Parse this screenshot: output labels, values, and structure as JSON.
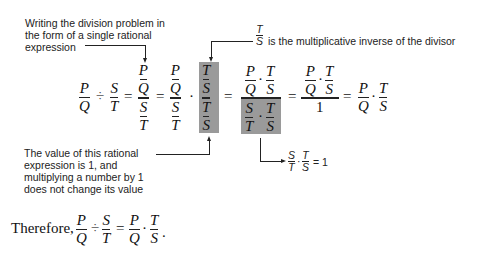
{
  "annotations": {
    "top_left_lines": [
      "Writing the division problem in",
      "the form of a single rational",
      "expression"
    ],
    "top_right": {
      "frac_num": "T",
      "frac_den": "S",
      "text": "is the multiplicative inverse of the divisor"
    },
    "bottom_left_lines": [
      "The value of this rational",
      "expression is 1, and",
      "multiplying a number by 1",
      "does not change its value"
    ],
    "bottom_right": {
      "f1_num": "S",
      "f1_den": "T",
      "dot": "·",
      "f2_num": "T",
      "f2_den": "S",
      "equals": "= 1"
    }
  },
  "equation": {
    "lhs": {
      "f1_num": "P",
      "f1_den": "Q",
      "div": "÷",
      "f2_num": "S",
      "f2_den": "T"
    },
    "step1": {
      "top_num": "P",
      "top_den": "Q",
      "bot_num": "S",
      "bot_den": "T"
    },
    "step2": {
      "top_num": "P",
      "top_den": "Q",
      "bot_num": "S",
      "bot_den": "T",
      "dot": "·",
      "h_top_num": "T",
      "h_top_den": "S",
      "h_bot_num": "T",
      "h_bot_den": "S"
    },
    "step3": {
      "n1_num": "P",
      "n1_den": "Q",
      "n2_num": "T",
      "n2_den": "S",
      "d1_num": "S",
      "d1_den": "T",
      "d2_num": "T",
      "d2_den": "S",
      "dot": "·"
    },
    "step4": {
      "n1_num": "P",
      "n1_den": "Q",
      "n2_num": "T",
      "n2_den": "S",
      "den": "1",
      "dot": "·"
    },
    "step5": {
      "f1_num": "P",
      "f1_den": "Q",
      "f2_num": "T",
      "f2_den": "S",
      "dot": "·"
    },
    "equals": "="
  },
  "conclusion": {
    "prefix": "Therefore,",
    "f1_num": "P",
    "f1_den": "Q",
    "div": "÷",
    "f2_num": "S",
    "f2_den": "T",
    "equals": "=",
    "f3_num": "P",
    "f3_den": "Q",
    "dot": "·",
    "f4_num": "T",
    "f4_den": "S",
    "period": "."
  },
  "colors": {
    "highlight": "#9a9a9a"
  }
}
